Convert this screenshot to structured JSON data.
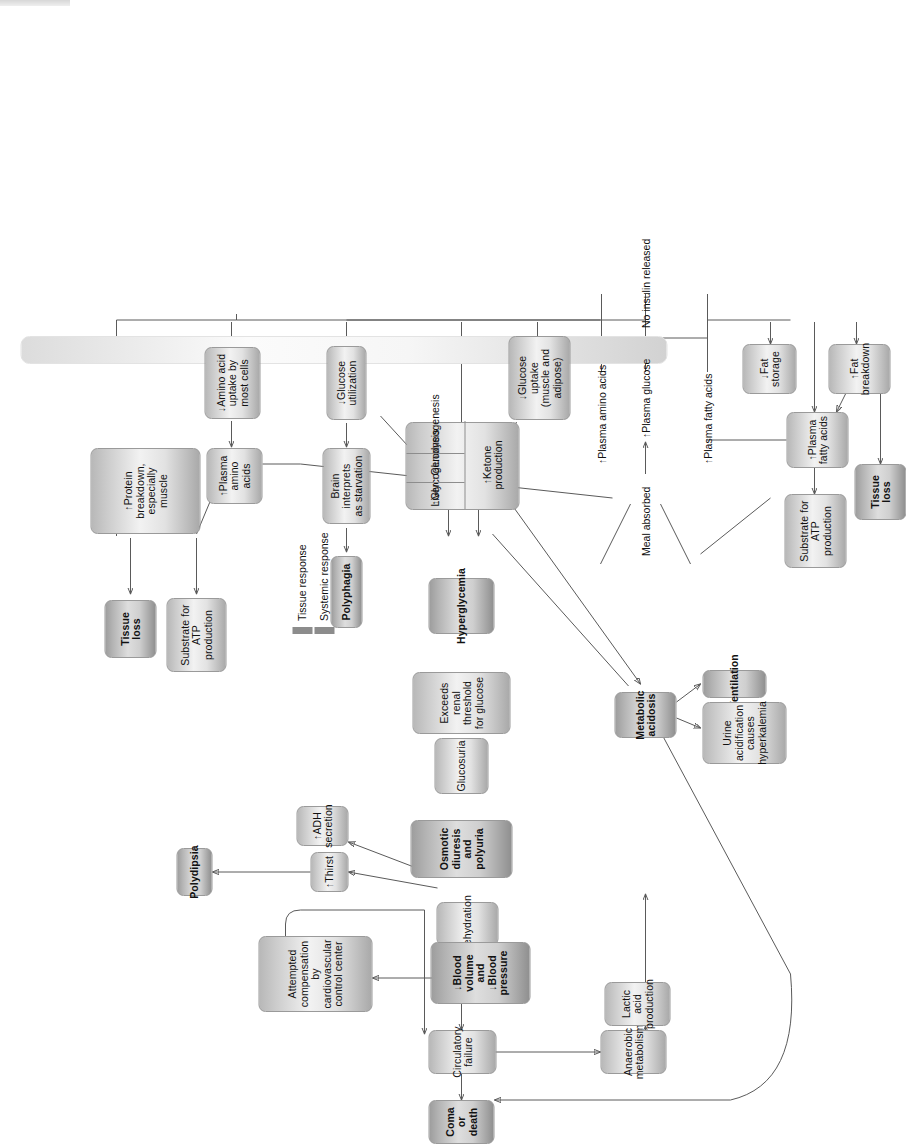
{
  "diagram": {
    "orientation": "rotated-90-ccw",
    "legend": {
      "items": [
        {
          "label": "Tissue response",
          "color": "#8c8c8c"
        },
        {
          "label": "Systemic response",
          "color": "#8c8c8c"
        }
      ]
    },
    "spine_labels": [
      {
        "id": "meal",
        "text": "Meal absorbed"
      },
      {
        "id": "plasma-amino-acids",
        "text": "↑Plasma amino acids"
      },
      {
        "id": "plasma-glucose",
        "text": "↑Plasma glucose"
      },
      {
        "id": "plasma-fatty-acids",
        "text": "↑Plasma fatty acids"
      },
      {
        "id": "no-insulin",
        "text": "No insulin released"
      }
    ],
    "annotations": [
      {
        "id": "compensation-fails",
        "line1": "compensation",
        "line2": "fails"
      }
    ],
    "nodes": [
      {
        "id": "amino-acid-uptake",
        "text": "↓Amino acid\nuptake by\nmost cells",
        "kind": "tissue"
      },
      {
        "id": "protein-breakdown",
        "text": "↑Protein\nbreakdown,\nespecially muscle",
        "kind": "tissue"
      },
      {
        "id": "plasma-amino-acids-box",
        "text": "↑Plasma\namino acids",
        "kind": "tissue"
      },
      {
        "id": "tissue-loss-top",
        "text": "Tissue\nloss",
        "kind": "systemic"
      },
      {
        "id": "substrate-atp-top",
        "text": "Substrate for\nATP production",
        "kind": "tissue"
      },
      {
        "id": "glucose-utilization",
        "text": "↓Glucose utilization",
        "kind": "tissue"
      },
      {
        "id": "brain-starvation",
        "text": "Brain interprets\nas starvation",
        "kind": "tissue"
      },
      {
        "id": "polyphagia",
        "text": "Polyphagia",
        "kind": "systemic"
      },
      {
        "id": "glucose-uptake",
        "text": "↓Glucose uptake\n(muscle and adipose)",
        "kind": "tissue"
      },
      {
        "id": "liver",
        "text": "Liver",
        "kind": "tissue"
      },
      {
        "id": "glycogenolysis",
        "text": "↑Glycogenolysis",
        "kind": "tissue"
      },
      {
        "id": "gluconeogenesis",
        "text": "↑Gluconeogenesis",
        "kind": "tissue"
      },
      {
        "id": "ketone-production",
        "text": "↑Ketone\nproduction",
        "kind": "tissue"
      },
      {
        "id": "hyperglycemia",
        "text": "Hyperglycemia",
        "kind": "systemic"
      },
      {
        "id": "exceeds-renal-threshold",
        "text": "Exceeds renal\nthreshold for glucose",
        "kind": "tissue"
      },
      {
        "id": "glucosuria",
        "text": "Glucosuria",
        "kind": "tissue"
      },
      {
        "id": "osmotic-diuresis",
        "text": "Osmotic diuresis\nand polyuria",
        "kind": "systemic"
      },
      {
        "id": "dehydration",
        "text": "Dehydration",
        "kind": "tissue"
      },
      {
        "id": "thirst",
        "text": "↑Thirst",
        "kind": "tissue"
      },
      {
        "id": "adh-secretion",
        "text": "↑ADH secretion",
        "kind": "tissue"
      },
      {
        "id": "polydipsia",
        "text": "Polydipsia",
        "kind": "systemic"
      },
      {
        "id": "blood-volume-pressure",
        "text": "↓Blood volume\nand\n↓Blood pressure",
        "kind": "systemic"
      },
      {
        "id": "attempted-compensation",
        "text": "Attempted compensation by\ncardiovascular control center",
        "kind": "tissue"
      },
      {
        "id": "circulatory-failure",
        "text": "Circulatory failure",
        "kind": "tissue"
      },
      {
        "id": "coma-or-death",
        "text": "Coma or death",
        "kind": "systemic"
      },
      {
        "id": "anaerobic-metabolism",
        "text": "Anaerobic\nmetabolism",
        "kind": "tissue"
      },
      {
        "id": "lactic-acid-production",
        "text": "Lactic acid\nproduction",
        "kind": "tissue"
      },
      {
        "id": "metabolic-acidosis",
        "text": "Metabolic\nacidosis",
        "kind": "systemic"
      },
      {
        "id": "ventilation",
        "text": "↑Ventilation",
        "kind": "systemic"
      },
      {
        "id": "urine-acidification",
        "text": "Urine\nacidification\ncauses\nhyperkalemia",
        "kind": "tissue"
      },
      {
        "id": "fat-storage",
        "text": "↓Fat\nstorage",
        "kind": "tissue"
      },
      {
        "id": "fat-breakdown",
        "text": "↑Fat\nbreakdown",
        "kind": "tissue"
      },
      {
        "id": "plasma-fatty-acids-box",
        "text": "↑Plasma\nfatty acids",
        "kind": "tissue"
      },
      {
        "id": "substrate-atp-bottom",
        "text": "Substrate for\nATP production",
        "kind": "tissue"
      },
      {
        "id": "tissue-loss-bottom",
        "text": "Tissue\nloss",
        "kind": "systemic"
      }
    ]
  }
}
